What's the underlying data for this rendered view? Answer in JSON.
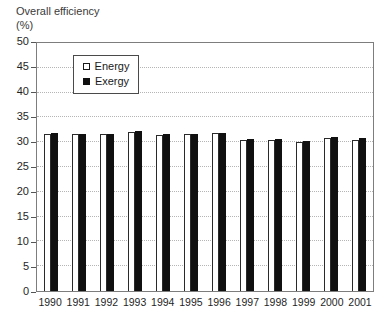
{
  "chart_data": {
    "type": "bar",
    "title": "Overall efficiency (%)",
    "ylabel": "Overall efficiency (%)",
    "xlabel": "",
    "categories": [
      "1990",
      "1991",
      "1992",
      "1993",
      "1994",
      "1995",
      "1996",
      "1997",
      "1998",
      "1999",
      "2000",
      "2001"
    ],
    "series": [
      {
        "name": "Energy",
        "fill": "#ffffff",
        "values": [
          31.7,
          31.6,
          31.6,
          32.1,
          31.4,
          31.6,
          31.8,
          30.5,
          30.5,
          30.1,
          30.9,
          30.5
        ]
      },
      {
        "name": "Exergy",
        "fill": "#101010",
        "values": [
          31.9,
          31.7,
          31.7,
          32.3,
          31.6,
          31.7,
          31.9,
          30.7,
          30.7,
          30.3,
          31.1,
          30.8
        ]
      }
    ],
    "ylim": [
      0,
      50
    ],
    "ytick_step": 5,
    "grid": "horizontal-dotted",
    "gridline_color": "#b5b5b5",
    "legend_position": "upper-left-inside",
    "legend_labels": [
      "Energy",
      "Exergy"
    ]
  }
}
